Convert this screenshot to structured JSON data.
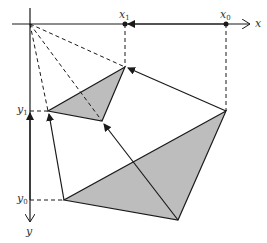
{
  "diagram": {
    "axis_labels": {
      "x": "x",
      "y": "y"
    },
    "x_markers": [
      {
        "id": "x1",
        "base": "x",
        "sub": "1"
      },
      {
        "id": "x0",
        "base": "x",
        "sub": "0"
      }
    ],
    "y_markers": [
      {
        "id": "y1",
        "base": "y",
        "sub": "1"
      },
      {
        "id": "y0",
        "base": "y",
        "sub": "0"
      }
    ],
    "colors": {
      "stroke": "#1a1a1a",
      "fill": "#bdbdbd",
      "text": "#333333"
    }
  }
}
